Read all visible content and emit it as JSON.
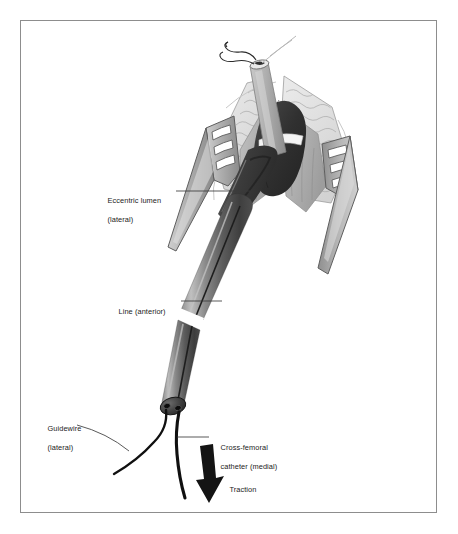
{
  "figure": {
    "domain": "medical-surgical-illustration",
    "frame": {
      "border_color": "#8d8d8d",
      "background": "#ffffff"
    }
  },
  "labels": [
    {
      "id": "eccentric-lumen",
      "line1": "Eccentric lumen",
      "line2": "(lateral)"
    },
    {
      "id": "line-anterior",
      "line1": "Line (anterior)",
      "line2": ""
    },
    {
      "id": "guidewire",
      "line1": "Guidewire",
      "line2": "(lateral)"
    },
    {
      "id": "cross-femoral-catheter",
      "line1": "Cross-femoral",
      "line2": "catheter (medial)"
    },
    {
      "id": "traction",
      "line1": "Traction",
      "line2": ""
    }
  ],
  "label_text": {
    "eccentric_lumen_line1": "Eccentric lumen",
    "eccentric_lumen_line2": "(lateral)",
    "line_anterior": "Line (anterior)",
    "guidewire_line1": "Guidewire",
    "guidewire_line2": "(lateral)",
    "cross_femoral_line1": "Cross-femoral",
    "cross_femoral_line2": "catheter (medial)",
    "traction": "Traction"
  },
  "colors": {
    "frame_border": "#8d8d8d",
    "background": "#ffffff",
    "label_ink": "#1b1b1b",
    "leader_line": "#4a4a4a",
    "retractor_light": "#d2d2d2",
    "retractor_mid": "#a8a8a8",
    "retractor_dark": "#7d7d7d",
    "retractor_outline": "#5a5a5a",
    "fat_tissue_light": "#e4e4e4",
    "fat_tissue_outline": "#9a9a9a",
    "muscle_mid": "#b4b4b4",
    "vessel_dark": "#3a3a3a",
    "vessel_darker": "#262626",
    "graft_tube_light": "#c6c6c6",
    "catheter_light": "#9e9e9e",
    "catheter_mid": "#6e6e6e",
    "catheter_dark": "#3f3f3f",
    "catheter_highlight": "#bcbcbc",
    "suture_band_white": "#f6f6f6",
    "wire_black": "#0d0d0d",
    "arrow_black": "#141414"
  },
  "elements": {
    "retractor_left": {
      "name": "self-retaining-retractor-left",
      "slots": 3
    },
    "retractor_right": {
      "name": "self-retaining-retractor-right",
      "slots": 3
    },
    "graft_tube": {
      "name": "vascular-graft-tube"
    },
    "suture_loop": {
      "name": "suture-loop-hook"
    },
    "vessel": {
      "name": "femoral-vessel-dark"
    },
    "suture_band": {
      "name": "ligature-band-white"
    },
    "catheter_shaft": {
      "name": "cross-femoral-catheter-shaft"
    },
    "catheter_hub": {
      "name": "catheter-hub-end-cap",
      "lumen_count": 2
    },
    "guidewire": {
      "name": "guidewire-strand"
    },
    "catheter_tail": {
      "name": "catheter-tail-strand"
    },
    "traction_arrow": {
      "name": "traction-arrow",
      "direction": "down-right"
    }
  }
}
